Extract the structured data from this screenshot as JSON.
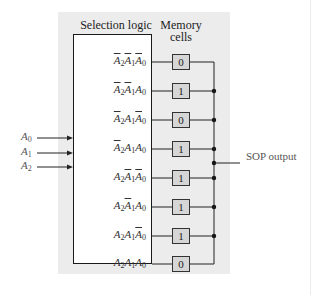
{
  "diagram": {
    "headers": {
      "selection_logic": "Selection logic",
      "memory_cells_line1": "Memory",
      "memory_cells_line2": "cells"
    },
    "inputs": [
      {
        "base": "A",
        "sub": "0"
      },
      {
        "base": "A",
        "sub": "1"
      },
      {
        "base": "A",
        "sub": "2"
      }
    ],
    "rows": [
      {
        "term": [
          {
            "v": "A",
            "s": "2",
            "bar": true
          },
          {
            "v": "A",
            "s": "1",
            "bar": true
          },
          {
            "v": "A",
            "s": "0",
            "bar": true
          }
        ],
        "value": "0"
      },
      {
        "term": [
          {
            "v": "A",
            "s": "2",
            "bar": true
          },
          {
            "v": "A",
            "s": "1",
            "bar": true
          },
          {
            "v": "A",
            "s": "0",
            "bar": false
          }
        ],
        "value": "1"
      },
      {
        "term": [
          {
            "v": "A",
            "s": "2",
            "bar": true
          },
          {
            "v": "A",
            "s": "1",
            "bar": false
          },
          {
            "v": "A",
            "s": "0",
            "bar": true
          }
        ],
        "value": "0"
      },
      {
        "term": [
          {
            "v": "A",
            "s": "2",
            "bar": true
          },
          {
            "v": "A",
            "s": "1",
            "bar": false
          },
          {
            "v": "A",
            "s": "0",
            "bar": false
          }
        ],
        "value": "1"
      },
      {
        "term": [
          {
            "v": "A",
            "s": "2",
            "bar": false
          },
          {
            "v": "A",
            "s": "1",
            "bar": true
          },
          {
            "v": "A",
            "s": "0",
            "bar": true
          }
        ],
        "value": "1"
      },
      {
        "term": [
          {
            "v": "A",
            "s": "2",
            "bar": false
          },
          {
            "v": "A",
            "s": "1",
            "bar": true
          },
          {
            "v": "A",
            "s": "0",
            "bar": false
          }
        ],
        "value": "1"
      },
      {
        "term": [
          {
            "v": "A",
            "s": "2",
            "bar": false
          },
          {
            "v": "A",
            "s": "1",
            "bar": false
          },
          {
            "v": "A",
            "s": "0",
            "bar": true
          }
        ],
        "value": "1"
      },
      {
        "term": [
          {
            "v": "A",
            "s": "2",
            "bar": false
          },
          {
            "v": "A",
            "s": "1",
            "bar": false
          },
          {
            "v": "A",
            "s": "0",
            "bar": false
          }
        ],
        "value": "0"
      }
    ],
    "output_label": "SOP output"
  }
}
